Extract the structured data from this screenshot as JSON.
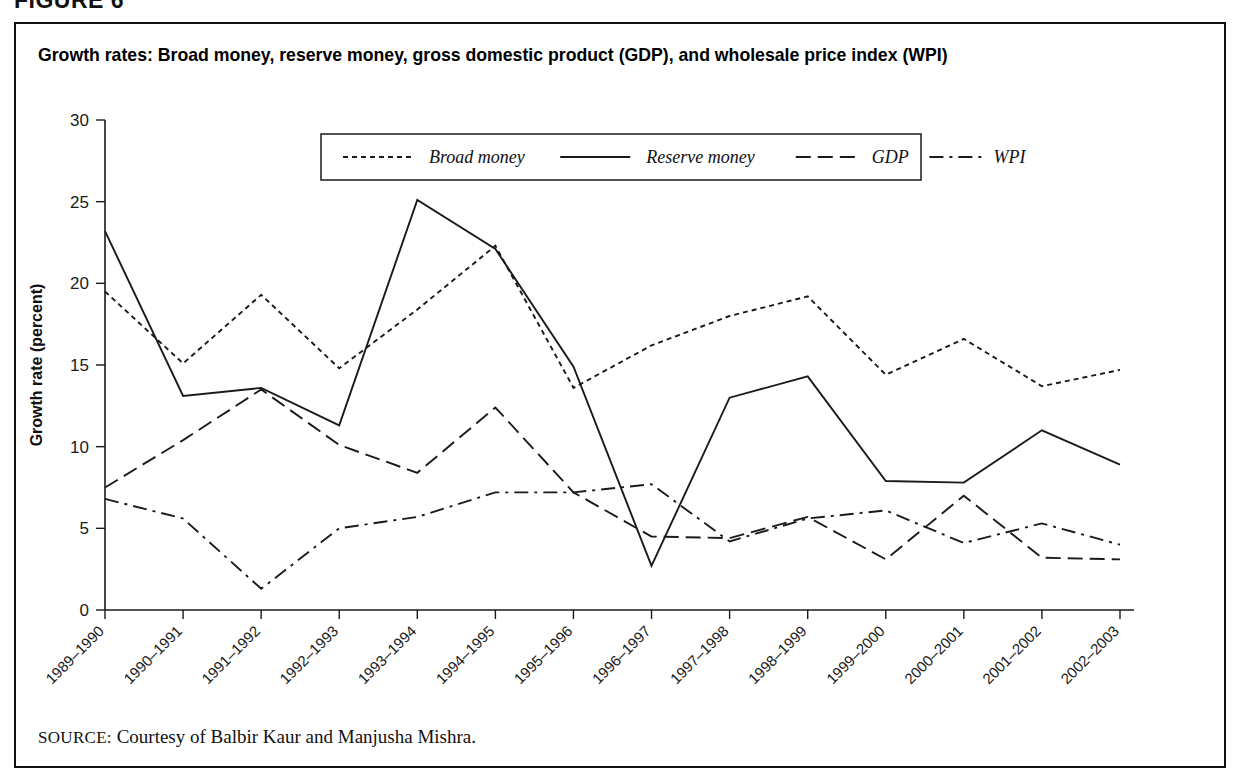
{
  "figure": {
    "number_label": "FIGURE 6",
    "title": "Growth rates: Broad money, reserve money, gross domestic product (GDP), and wholesale price index (WPI)",
    "source_label": "SOURCE:",
    "source_text": "Courtesy of Balbir Kaur and Manjusha Mishra."
  },
  "chart_data": {
    "type": "line",
    "title": "Growth rates: Broad money, reserve money, gross domestic product (GDP), and wholesale price index (WPI)",
    "xlabel": "",
    "ylabel": "Growth rate (percent)",
    "ylim": [
      0,
      30
    ],
    "yticks": [
      0,
      5,
      10,
      15,
      20,
      25,
      30
    ],
    "ytick_labels": [
      "0",
      "5",
      "10",
      "15",
      "20",
      "25",
      "30"
    ],
    "grid": false,
    "legend_position": "top-center",
    "categories": [
      "1989–1990",
      "1990–1991",
      "1991–1992",
      "1992–1993",
      "1993–1994",
      "1994–1995",
      "1995–1996",
      "1996–1997",
      "1997–1998",
      "1998–1999",
      "1999–2000",
      "2000–2001",
      "2001–2002",
      "2002–2003"
    ],
    "series": [
      {
        "name": "Broad money",
        "dash": "dotted",
        "stroke_width": 1.9,
        "dasharray": "5,4",
        "values": [
          19.5,
          15.1,
          19.3,
          14.8,
          18.4,
          22.3,
          13.6,
          16.2,
          18.0,
          19.2,
          14.4,
          16.6,
          13.7,
          14.7
        ]
      },
      {
        "name": "Reserve money",
        "dash": "solid",
        "stroke_width": 1.9,
        "dasharray": "none",
        "values": [
          23.2,
          13.1,
          13.6,
          11.3,
          25.1,
          22.1,
          14.9,
          2.7,
          13.0,
          14.3,
          7.9,
          7.8,
          11.0,
          8.9
        ]
      },
      {
        "name": "GDP",
        "dash": "dashed",
        "stroke_width": 1.9,
        "dasharray": "15,7",
        "values": [
          7.5,
          10.4,
          13.5,
          10.1,
          8.4,
          12.4,
          7.2,
          4.5,
          4.4,
          5.7,
          3.1,
          7.0,
          3.2,
          3.1
        ]
      },
      {
        "name": "WPI",
        "dash": "dashdot",
        "stroke_width": 1.9,
        "dasharray": "14,6,3,6",
        "values": [
          6.8,
          5.6,
          1.3,
          5.0,
          5.7,
          7.2,
          7.2,
          7.7,
          4.2,
          5.6,
          6.1,
          4.1,
          5.3,
          4.0
        ]
      }
    ]
  }
}
